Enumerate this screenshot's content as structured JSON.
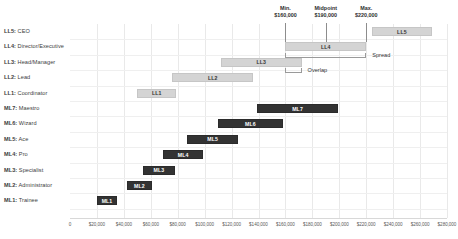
{
  "chart_data": {
    "type": "bar",
    "orientation": "horizontal",
    "title": "",
    "xlabel": "",
    "ylabel": "",
    "xlim": [
      0,
      280000
    ],
    "grid": true,
    "legend": null,
    "x_tick_labels": [
      "0",
      "$20,000",
      "$40,000",
      "$60,000",
      "$80,000",
      "$100,000",
      "$120,000",
      "$140,000",
      "$160,000",
      "$180,000",
      "$200,000",
      "$220,000",
      "$240,000",
      "$260,000",
      "$280,000"
    ],
    "x_tick_values": [
      0,
      20000,
      40000,
      60000,
      80000,
      100000,
      120000,
      140000,
      160000,
      180000,
      200000,
      220000,
      240000,
      260000,
      280000
    ],
    "categories": [
      "LL5: CEO",
      "LL4: Director/Executive",
      "LL3: Head/Manager",
      "LL2: Lead",
      "LL1: Coordinator",
      "ML7: Maestro",
      "ML6: Wizard",
      "ML5: Ace",
      "ML4: Pro",
      "ML3: Specialist",
      "ML2: Administrator",
      "ML1: Trainee"
    ],
    "series": [
      {
        "name": "Leadership Ladder",
        "color": "#d4d4d4",
        "bars": [
          {
            "category": "LL5: CEO",
            "label": "LL5",
            "start": 224000,
            "end": 269000
          },
          {
            "category": "LL4: Director/Executive",
            "label": "LL4",
            "start": 160000,
            "end": 220000
          },
          {
            "category": "LL3: Head/Manager",
            "label": "LL3",
            "start": 112000,
            "end": 172000
          },
          {
            "category": "LL2: Lead",
            "label": "LL2",
            "start": 76000,
            "end": 136000
          },
          {
            "category": "LL1: Coordinator",
            "label": "LL1",
            "start": 50000,
            "end": 79000
          }
        ]
      },
      {
        "name": "Maker Ladder",
        "color": "#333333",
        "bars": [
          {
            "category": "ML7: Maestro",
            "label": "ML7",
            "start": 139000,
            "end": 199000
          },
          {
            "category": "ML6: Wizard",
            "label": "ML6",
            "start": 110000,
            "end": 158000
          },
          {
            "category": "ML5: Ace",
            "label": "ML5",
            "start": 87000,
            "end": 125000
          },
          {
            "category": "ML4: Pro",
            "label": "ML4",
            "start": 69000,
            "end": 99000
          },
          {
            "category": "ML3: Specialist",
            "label": "ML3",
            "start": 54000,
            "end": 78000
          },
          {
            "category": "ML2: Administrator",
            "label": "ML2",
            "start": 42000,
            "end": 61000
          },
          {
            "category": "ML1: Trainee",
            "label": "ML1",
            "start": 20000,
            "end": 35000
          }
        ]
      }
    ],
    "markers": [
      {
        "name": "min",
        "title": "Min.",
        "value": 160000,
        "value_label": "$160,000"
      },
      {
        "name": "midpoint",
        "title": "Midpoint",
        "value": 190000,
        "value_label": "$190,000"
      },
      {
        "name": "max",
        "title": "Max.",
        "value": 220000,
        "value_label": "$220,000"
      }
    ],
    "annotations": [
      {
        "name": "spread",
        "text": "Spread",
        "from": 160000,
        "to": 220000
      },
      {
        "name": "overlap",
        "text": "Overlap",
        "from": 160000,
        "to": 172000
      }
    ]
  },
  "rows": [
    {
      "code": "LL5",
      "title": "CEO"
    },
    {
      "code": "LL4",
      "title": "Director/Executive"
    },
    {
      "code": "LL3",
      "title": "Head/Manager"
    },
    {
      "code": "LL2",
      "title": "Lead"
    },
    {
      "code": "LL1",
      "title": "Coordinator"
    },
    {
      "code": "ML7",
      "title": "Maestro"
    },
    {
      "code": "ML6",
      "title": "Wizard"
    },
    {
      "code": "ML5",
      "title": "Ace"
    },
    {
      "code": "ML4",
      "title": "Pro"
    },
    {
      "code": "ML3",
      "title": "Specialist"
    },
    {
      "code": "ML2",
      "title": "Administrator"
    },
    {
      "code": "ML1",
      "title": "Trainee"
    }
  ],
  "colors": {
    "light_bar": "#d4d4d4",
    "dark_bar": "#333333",
    "gridline": "#e9e9e9",
    "text": "#333333",
    "tick_text": "#5a5a5a",
    "marker_line": "#8d8d8d"
  }
}
